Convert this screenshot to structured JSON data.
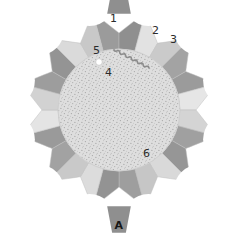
{
  "figure": {
    "panel_letter": "A",
    "background_color": "#ffffff",
    "center": {
      "x": 119,
      "y": 110
    },
    "inner_disc": {
      "radius": 61,
      "fill": "#dedede",
      "stipple_color": "#9a9a9a",
      "name": "speckled-inner-disc"
    },
    "ring": {
      "segment_count": 12,
      "inner_radius": 61,
      "outer_radius": 101,
      "scallop_radius": 26,
      "colors": {
        "dark": "#9b9b9b",
        "medium": "#b9b9b9",
        "light": "#d8d8d8",
        "pale": "#e6e6e6",
        "outline": "#bfbfbf"
      },
      "segments": [
        {
          "index": 0,
          "angle_deg": -90,
          "left_half": "#9b9b9b",
          "right_half": "#8f8f8f"
        },
        {
          "index": 1,
          "angle_deg": -60,
          "left_half": "#e2e2e2",
          "right_half": "#cacaca"
        },
        {
          "index": 2,
          "angle_deg": -30,
          "left_half": "#a3a3a3",
          "right_half": "#9b9b9b"
        },
        {
          "index": 3,
          "angle_deg": 0,
          "left_half": "#e6e6e6",
          "right_half": "#d4d4d4"
        },
        {
          "index": 4,
          "angle_deg": 30,
          "left_half": "#a0a0a0",
          "right_half": "#969696"
        },
        {
          "index": 5,
          "angle_deg": 60,
          "left_half": "#d9d9d9",
          "right_half": "#c6c6c6"
        },
        {
          "index": 6,
          "angle_deg": 90,
          "left_half": "#9e9e9e",
          "right_half": "#939393"
        },
        {
          "index": 7,
          "angle_deg": 120,
          "left_half": "#dcdcdc",
          "right_half": "#c9c9c9"
        },
        {
          "index": 8,
          "angle_deg": 150,
          "left_half": "#a2a2a2",
          "right_half": "#9a9a9a"
        },
        {
          "index": 9,
          "angle_deg": 180,
          "left_half": "#e4e4e4",
          "right_half": "#d2d2d2"
        },
        {
          "index": 10,
          "angle_deg": 210,
          "left_half": "#9d9d9d",
          "right_half": "#949494"
        },
        {
          "index": 11,
          "angle_deg": 240,
          "left_half": "#dadada",
          "right_half": "#c8c8c8"
        }
      ]
    },
    "nubs": [
      {
        "name": "top-nub",
        "angle_deg": -90,
        "fill": "#8f8f8f"
      },
      {
        "name": "bottom-nub",
        "angle_deg": 90,
        "fill": "#8f8f8f"
      }
    ],
    "serpentine_trace": {
      "name": "serpentine-zigzag-trace",
      "stroke": "#8c8c8c",
      "stroke_width": 1.6,
      "pass_count": 5,
      "description": "continuous crinkled line snaking diagonally back and forth across the inner disc, ending in a small vertical wiggle at lower right"
    },
    "white_dot": {
      "name": "white-marker-dot",
      "x": 99,
      "y": 62,
      "radius": 3.4,
      "fill": "#ffffff",
      "stroke": "#c9c9c9"
    },
    "callouts": [
      {
        "id": "1",
        "label": "1",
        "x": 110,
        "y": 13,
        "name": "callout-1"
      },
      {
        "id": "2",
        "label": "2",
        "x": 152,
        "y": 25,
        "name": "callout-2"
      },
      {
        "id": "3",
        "label": "3",
        "x": 170,
        "y": 34,
        "name": "callout-3"
      },
      {
        "id": "4",
        "label": "4",
        "x": 105,
        "y": 67,
        "name": "callout-4"
      },
      {
        "id": "5",
        "label": "5",
        "x": 93,
        "y": 45,
        "name": "callout-5"
      },
      {
        "id": "6",
        "label": "6",
        "x": 143,
        "y": 148,
        "name": "callout-6"
      }
    ]
  }
}
